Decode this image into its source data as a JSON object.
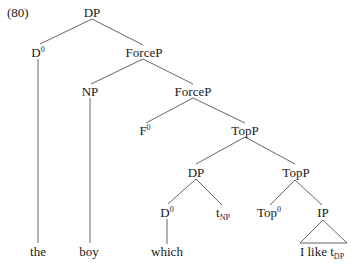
{
  "example_number": "(80)",
  "nodes": {
    "root_dp": {
      "label": "DP",
      "x": 92,
      "y": 12
    },
    "d0_top": {
      "label": "D",
      "sup": "0",
      "x": 38,
      "y": 52
    },
    "forcep_1": {
      "label": "ForceP",
      "x": 144,
      "y": 52
    },
    "np": {
      "label": "NP",
      "x": 90,
      "y": 91
    },
    "forcep_2": {
      "label": "ForceP",
      "x": 193,
      "y": 91
    },
    "f0": {
      "label": "F",
      "sup": "0",
      "x": 145,
      "y": 130
    },
    "topp_1": {
      "label": "TopP",
      "x": 245,
      "y": 130
    },
    "dp_2": {
      "label": "DP",
      "x": 196,
      "y": 172
    },
    "topp_2": {
      "label": "TopP",
      "x": 296,
      "y": 172
    },
    "d0_2": {
      "label": "D",
      "sup": "0",
      "x": 167,
      "y": 212
    },
    "t_np": {
      "label": "t",
      "sub": "NP",
      "x": 223,
      "y": 212
    },
    "top0": {
      "label": "Top",
      "sup": "0",
      "x": 269,
      "y": 212
    },
    "ip": {
      "label": "IP",
      "x": 323,
      "y": 212
    }
  },
  "leaves": {
    "the": {
      "label": "the",
      "x": 38,
      "y": 251
    },
    "boy": {
      "label": "boy",
      "x": 89,
      "y": 251
    },
    "which": {
      "label": "which",
      "x": 167,
      "y": 251
    },
    "i_like": {
      "label": "I like t",
      "sub": "DP",
      "x": 322,
      "y": 251
    }
  },
  "edges": [
    [
      92,
      19,
      40,
      44
    ],
    [
      92,
      19,
      143,
      45
    ],
    [
      38,
      59,
      38,
      243
    ],
    [
      143,
      59,
      91,
      84
    ],
    [
      143,
      59,
      193,
      84
    ],
    [
      90,
      98,
      90,
      243
    ],
    [
      193,
      98,
      146,
      123
    ],
    [
      193,
      98,
      245,
      123
    ],
    [
      245,
      137,
      196,
      164
    ],
    [
      245,
      137,
      295,
      164
    ],
    [
      196,
      179,
      168,
      204
    ],
    [
      196,
      179,
      222,
      205
    ],
    [
      295,
      180,
      270,
      205
    ],
    [
      295,
      180,
      322,
      205
    ],
    [
      167,
      219,
      167,
      244
    ]
  ],
  "triangle": {
    "top": [
      323,
      220
    ],
    "left": [
      300,
      243
    ],
    "right": [
      347,
      243
    ]
  }
}
